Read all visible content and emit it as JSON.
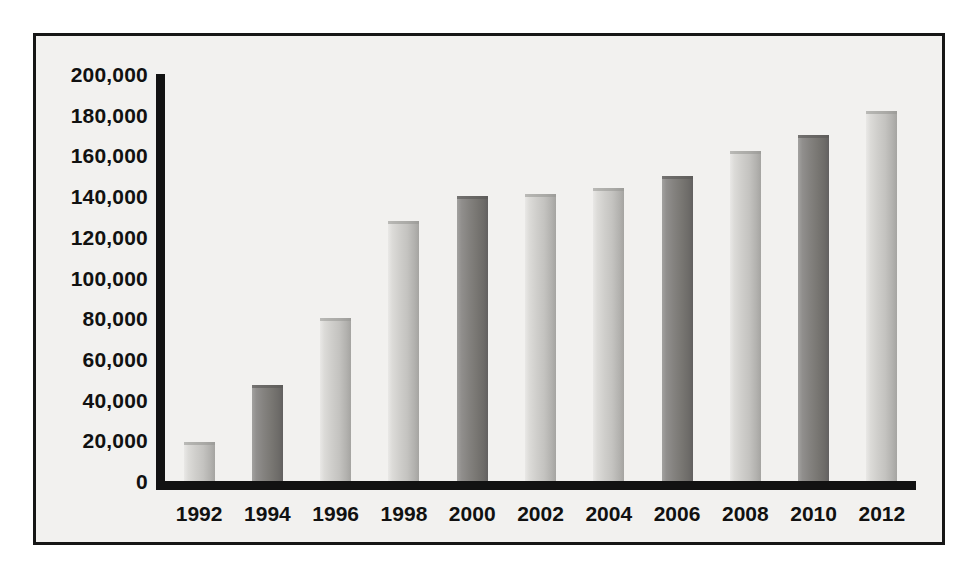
{
  "chart_data": {
    "type": "bar",
    "title": "",
    "subtitle": "",
    "xlabel": "",
    "ylabel": "",
    "categories": [
      "1992",
      "1994",
      "1996",
      "1998",
      "2000",
      "2002",
      "2004",
      "2006",
      "2008",
      "2010",
      "2012"
    ],
    "values": [
      19000,
      47000,
      80000,
      128000,
      140000,
      141000,
      144000,
      150000,
      162000,
      170000,
      182000
    ],
    "series": [
      {
        "name": "",
        "values": [
          19000,
          47000,
          80000,
          128000,
          140000,
          141000,
          144000,
          150000,
          162000,
          170000,
          182000
        ]
      }
    ],
    "ylim": [
      0,
      200000
    ],
    "ytick_values": [
      0,
      20000,
      40000,
      60000,
      80000,
      100000,
      120000,
      140000,
      160000,
      180000,
      200000
    ],
    "ytick_labels": [
      "0",
      "20,000",
      "40,000",
      "60,000",
      "80,000",
      "100,000",
      "120,000",
      "140,000",
      "160,000",
      "180,000",
      "200,000"
    ],
    "xtick_labels": [
      "1992",
      "1994",
      "1996",
      "1998",
      "2000",
      "2002",
      "2004",
      "2006",
      "2008",
      "2010",
      "2012"
    ],
    "grid": false,
    "legend": false,
    "legend_position": "none",
    "bar_shades": [
      "light",
      "dark",
      "light",
      "light",
      "dark",
      "light",
      "light",
      "dark",
      "light",
      "dark",
      "light"
    ],
    "annotations": []
  },
  "style": {
    "plot_background": "#f2f1ef",
    "frame_border_color": "#161616",
    "axis_color": "#121212",
    "tick_label_color": "#111111",
    "bar_light_color": "#cfcecb",
    "bar_dark_color": "#84827f"
  }
}
